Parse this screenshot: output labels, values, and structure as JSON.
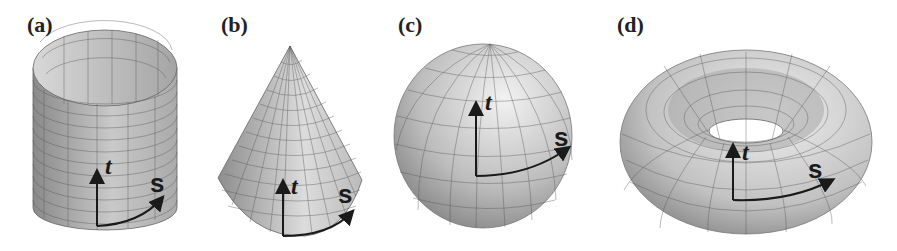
{
  "figure": {
    "panels": [
      {
        "label": "(a)",
        "shape": "cylinder",
        "axes": {
          "vertical": "t",
          "horizontal": "s"
        }
      },
      {
        "label": "(b)",
        "shape": "cone",
        "axes": {
          "vertical": "t",
          "horizontal": "s"
        }
      },
      {
        "label": "(c)",
        "shape": "sphere",
        "axes": {
          "vertical": "t",
          "horizontal": "s"
        }
      },
      {
        "label": "(d)",
        "shape": "torus",
        "axes": {
          "vertical": "t",
          "horizontal": "s"
        }
      }
    ]
  }
}
